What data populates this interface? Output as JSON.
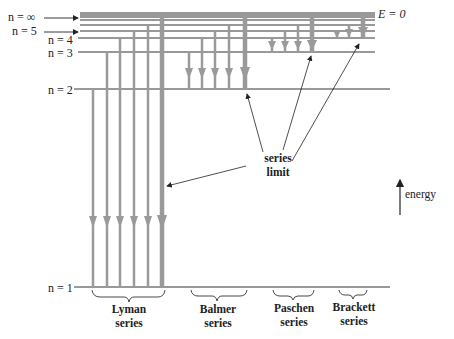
{
  "levels": [
    {
      "n": "1",
      "label": "n = 1",
      "y": 287
    },
    {
      "n": "2",
      "label": "n = 2",
      "y": 89
    },
    {
      "n": "3",
      "label": "n = 3",
      "y": 52
    },
    {
      "n": "4",
      "label": "n = 4",
      "y": 38
    },
    {
      "n": "5",
      "label": "n = 5",
      "y": 31
    },
    {
      "n": "∞",
      "label": "n = ∞",
      "y": 13
    }
  ],
  "zero_energy_label": "E = 0",
  "energy_axis_label": "energy",
  "series_limit_label": [
    "series",
    "limit"
  ],
  "series": [
    {
      "name": "Lyman",
      "line1": "Lyman",
      "line2": "series",
      "lower_level": "1"
    },
    {
      "name": "Balmer",
      "line1": "Balmer",
      "line2": "series",
      "lower_level": "2"
    },
    {
      "name": "Paschen",
      "line1": "Paschen",
      "line2": "series",
      "lower_level": "3"
    },
    {
      "name": "Brackett",
      "line1": "Brackett",
      "line2": "series",
      "lower_level": "4"
    }
  ],
  "colors": {
    "level_line": "#333333",
    "transition_arrow": "#9a9a9a",
    "annotation": "#222222"
  }
}
